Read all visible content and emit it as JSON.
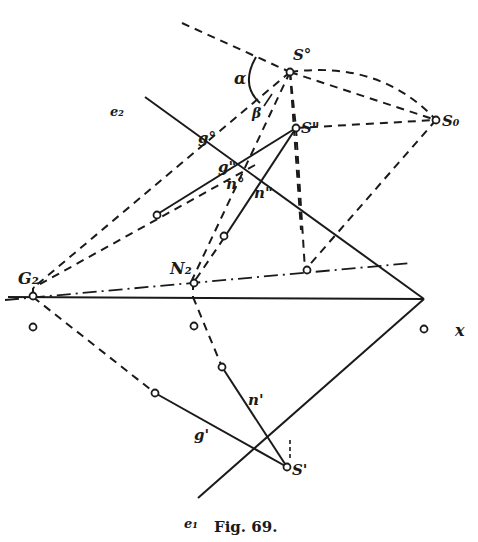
{
  "figure": {
    "caption": "Fig. 69.",
    "labels": {
      "S0_upper": "S°",
      "S_double": "S\"",
      "S_sub0": "S₀",
      "S_prime": "S'",
      "alpha": "α",
      "beta": "β",
      "e2": "e₂",
      "e1": "e₁",
      "g0": "g°",
      "g2": "g\"",
      "n0": "n°",
      "n2": "n\"",
      "n1": "n'",
      "g1": "g'",
      "G2": "G₂",
      "N2": "N₂",
      "x": "x"
    }
  }
}
